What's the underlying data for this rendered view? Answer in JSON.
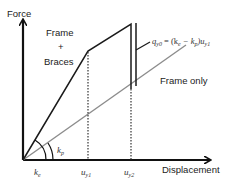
{
  "diagram": {
    "axes": {
      "y_label": "Force",
      "x_label": "Displacement"
    },
    "curves": {
      "frame_braces_label_line1": "Frame",
      "frame_braces_label_plus": "+",
      "frame_braces_label_line2": "Braces",
      "frame_only_label": "Frame only"
    },
    "annotations": {
      "qy0_lhs": "q",
      "qy0_lhs_sub": "y0",
      "qy0_rhs_prefix": " = (k",
      "qy0_ke_sub": "e",
      "qy0_minus": " − k",
      "qy0_kp_sub": "p",
      "qy0_close": ")u",
      "qy0_u_sub": "y1",
      "kp_label": "k",
      "kp_sub": "p",
      "ke_label": "k",
      "ke_sub": "e",
      "uy1_label": "u",
      "uy1_sub": "y1",
      "uy2_label": "u",
      "uy2_sub": "y2"
    },
    "colors": {
      "axis": "#111111",
      "frame_braces_line": "#1a1a1a",
      "frame_only_line": "#8c8c8c",
      "dotted": "#333333"
    }
  }
}
